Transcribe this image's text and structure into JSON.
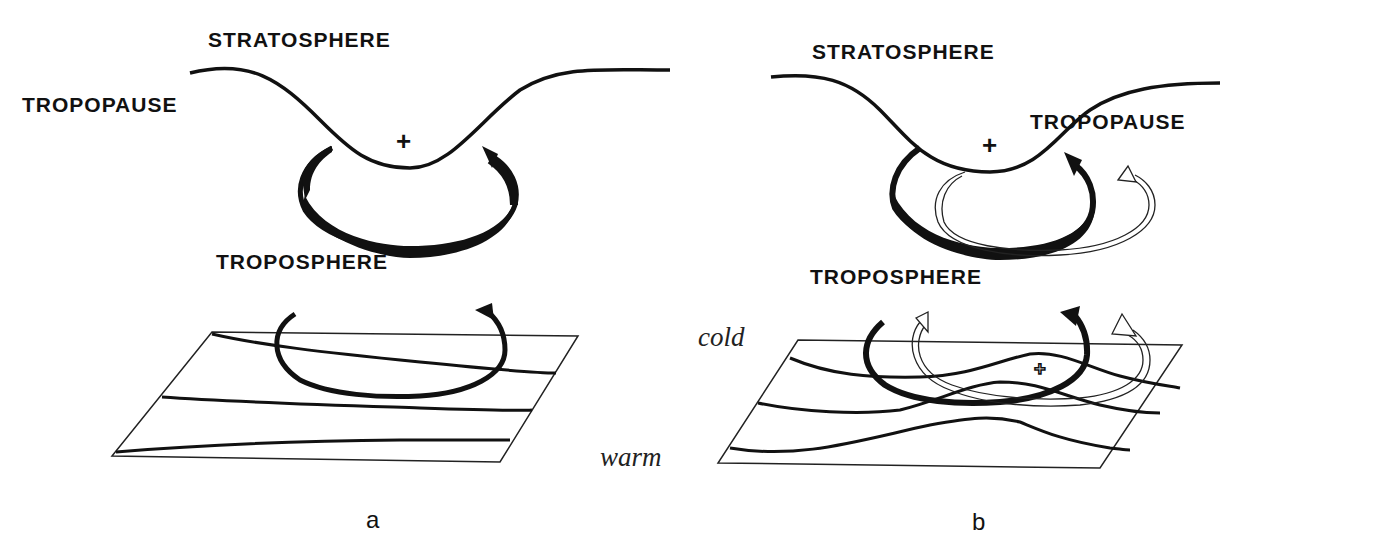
{
  "figure": {
    "panels": [
      {
        "id": "a",
        "caption": "a",
        "labels": {
          "stratosphere": "STRATOSPHERE",
          "tropopause": "TROPOPAUSE",
          "troposphere": "TROPOSPHERE"
        },
        "anomaly_symbol": "+"
      },
      {
        "id": "b",
        "caption": "b",
        "labels": {
          "stratosphere": "STRATOSPHERE",
          "tropopause": "TROPOPAUSE",
          "troposphere": "TROPOSPHERE"
        },
        "anomaly_symbol": "+",
        "surface_anomaly_symbol": "+"
      }
    ],
    "surface_labels": {
      "cold": "cold",
      "warm": "warm"
    }
  }
}
